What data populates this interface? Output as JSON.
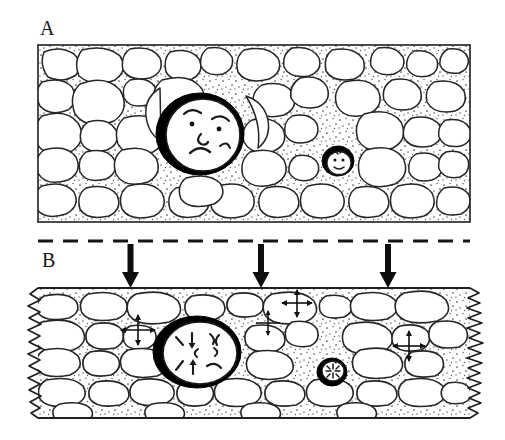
{
  "figure": {
    "panels": [
      {
        "id": "A",
        "label": "A",
        "caption": "Uncompacted conglomerate: rounded clasts supported by stippled matrix, point contacts preserved",
        "frame": {
          "x": 38,
          "y": 45,
          "width": 432,
          "height": 177
        },
        "border_style": "thin-rectangle",
        "matrix_texture": "stipple",
        "faces": [
          {
            "name": "large-clast-face",
            "expression": "worried",
            "rim": "thick-black",
            "cx": 200,
            "cy": 134,
            "rx": 42,
            "ry": 39,
            "features": [
              "eyebrow-left",
              "eyebrow-right",
              "eye-left",
              "eye-right",
              "nose",
              "frown-mouth"
            ]
          },
          {
            "name": "small-clast-face",
            "expression": "smiling",
            "rim": "thick-black",
            "cx": 338,
            "cy": 161,
            "rx": 15,
            "ry": 14,
            "features": [
              "eye-left",
              "eye-right",
              "smile-mouth",
              "hair-tuft"
            ]
          }
        ]
      },
      {
        "id": "B",
        "label": "B",
        "caption": "Compacted conglomerate: clasts flattened and interpenetrating, stylolitic seams on margins",
        "frame": {
          "x": 38,
          "y": 288,
          "width": 432,
          "height": 130
        },
        "border_style": "zigzag-stylolite-sides",
        "matrix_texture": "stipple",
        "faces": [
          {
            "name": "large-clast-face",
            "expression": "squeezed",
            "rim": "thick-black",
            "cx": 197,
            "cy": 352,
            "rx": 42,
            "ry": 34,
            "features": [
              "stress-tick-upper-left",
              "stress-tick-upper-right",
              "inward-arrow-down",
              "inward-arrow-up",
              "grimace-mouth",
              "crease-left",
              "crease-right"
            ]
          },
          {
            "name": "small-clast-face",
            "expression": "crushed",
            "rim": "thick-black",
            "cx": 332,
            "cy": 372,
            "rx": 14,
            "ry": 13,
            "features": [
              "starburst-creases",
              "tiny-mouth"
            ]
          }
        ]
      }
    ],
    "load_indicator": {
      "name": "overburden-dashed-line",
      "y": 241,
      "x_start": 38,
      "x_end": 470,
      "style": "dashed",
      "dash_length": 14,
      "dash_gap": 10,
      "arrows": [
        {
          "name": "load-arrow-left",
          "x": 131,
          "y_top": 244,
          "y_bottom": 288
        },
        {
          "name": "load-arrow-center",
          "x": 261,
          "y_top": 244,
          "y_bottom": 288
        },
        {
          "name": "load-arrow-right",
          "x": 388,
          "y_top": 244,
          "y_bottom": 288
        }
      ]
    },
    "stress_crosses": [
      {
        "name": "stress-cross-1",
        "cx": 138,
        "cy": 330,
        "arm": 17
      },
      {
        "name": "stress-cross-2",
        "cx": 297,
        "cy": 303,
        "arm": 15
      },
      {
        "name": "stress-cross-3",
        "cx": 409,
        "cy": 346,
        "arm": 16
      },
      {
        "name": "stress-cross-4",
        "cx": 268,
        "cy": 323,
        "arm": 12
      }
    ],
    "colors": {
      "ink": "#1a1a1a",
      "outline": "#262626",
      "rim": "#000000",
      "matrix_dot": "#4a4a4a",
      "background": "#ffffff"
    }
  }
}
